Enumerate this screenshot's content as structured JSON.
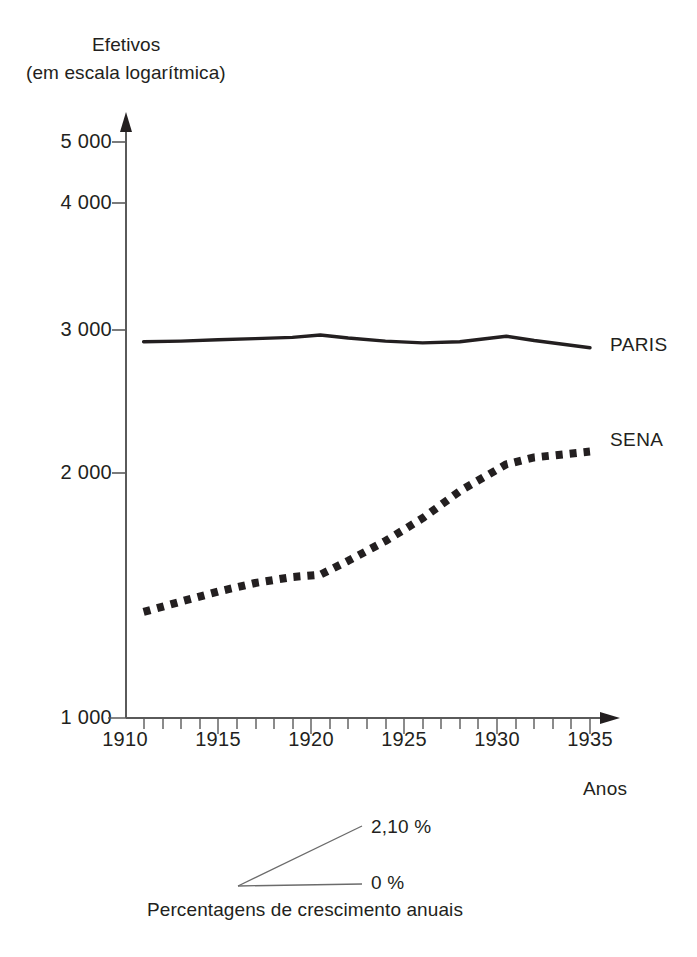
{
  "figure": {
    "background_color": "#ffffff",
    "ink_color": "#231f20",
    "width": 697,
    "height": 957
  },
  "axis_titles": {
    "y_line1": "Efetivos",
    "y_line2": "(em escala logarítmica)",
    "x": "Anos"
  },
  "series_labels": {
    "paris": "PARIS",
    "sena": "SENA"
  },
  "slope_legend": {
    "top_label": "2,10 %",
    "bottom_label": "0 %",
    "caption": "Percentagens de crescimento anuais"
  },
  "y_ticks": [
    {
      "value": 1000,
      "label": "1 000"
    },
    {
      "value": 2000,
      "label": "2 000"
    },
    {
      "value": 3000,
      "label": "3 000"
    },
    {
      "value": 4000,
      "label": "4 000"
    },
    {
      "value": 5000,
      "label": "5 000"
    }
  ],
  "x_ticks": [
    {
      "value": 1910,
      "label": "1910"
    },
    {
      "value": 1915,
      "label": "1915"
    },
    {
      "value": 1920,
      "label": "1920"
    },
    {
      "value": 1925,
      "label": "1925"
    },
    {
      "value": 1930,
      "label": "1930"
    },
    {
      "value": 1935,
      "label": "1935"
    }
  ],
  "chart_data": {
    "type": "line",
    "title": "Efetivos (em escala logarítmica)",
    "xlabel": "Anos",
    "ylabel": "Efetivos (em escala logarítmica)",
    "yscale": "log",
    "ylim": [
      1000,
      5500
    ],
    "xlim": [
      1910,
      1936
    ],
    "grid": false,
    "legend": "inline-right",
    "ytick_values": [
      1000,
      2000,
      3000,
      4000,
      5000
    ],
    "ytick_labels": [
      "1 000",
      "2 000",
      "3 000",
      "4 000",
      "5 000"
    ],
    "xtick_values": [
      1910,
      1915,
      1920,
      1925,
      1930,
      1935
    ],
    "xtick_labels": [
      "1910",
      "1915",
      "1920",
      "1925",
      "1930",
      "1935"
    ],
    "xminor_tick_step": 1,
    "series": [
      {
        "name": "PARIS",
        "style": "solid",
        "color": "#231f20",
        "x": [
          1911,
          1913,
          1915,
          1917,
          1919,
          1920.5,
          1922,
          1924,
          1926,
          1928,
          1930.5,
          1932,
          1935
        ],
        "values": [
          2900,
          2905,
          2915,
          2925,
          2935,
          2955,
          2930,
          2905,
          2890,
          2900,
          2945,
          2910,
          2850
        ]
      },
      {
        "name": "SENA",
        "style": "dotted-thick",
        "color": "#231f20",
        "x": [
          1911,
          1913,
          1915,
          1917,
          1919,
          1920.5,
          1922,
          1924,
          1926,
          1928,
          1930.5,
          1932,
          1935
        ],
        "values": [
          1350,
          1390,
          1430,
          1465,
          1490,
          1500,
          1560,
          1650,
          1760,
          1900,
          2050,
          2090,
          2125
        ]
      }
    ],
    "annotations": [
      {
        "text": "2,10 %",
        "kind": "slope-reference-upper"
      },
      {
        "text": "0 %",
        "kind": "slope-reference-lower"
      },
      {
        "text": "Percentagens de crescimento anuais",
        "kind": "slope-legend-caption"
      }
    ]
  }
}
